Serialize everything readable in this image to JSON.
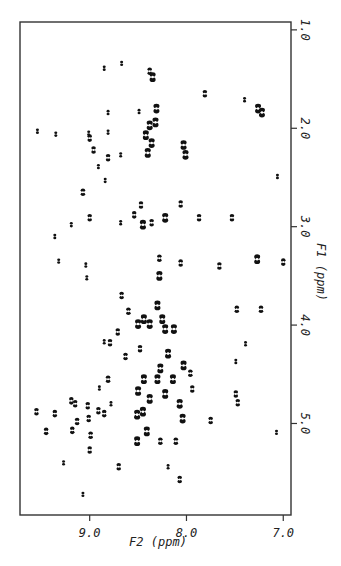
{
  "chart_data": {
    "type": "scatter",
    "subtype": "2D NMR contour plot",
    "title": "",
    "xlabel": "F2  (ppm)",
    "ylabel": "F1  (ppm)",
    "xlim": [
      9.72,
      6.92
    ],
    "ylim": [
      0.92,
      5.93
    ],
    "x_reversed": true,
    "y_direction": "increasing downward",
    "y_axis_side": "right",
    "grid": false,
    "legend": "none",
    "x_ticks": [
      {
        "value": 9.0,
        "label": "9.0"
      },
      {
        "value": 8.0,
        "label": "8.0"
      },
      {
        "value": 7.0,
        "label": "7.0"
      }
    ],
    "y_ticks": [
      {
        "value": 1.0,
        "label": "1.0"
      },
      {
        "value": 2.0,
        "label": "2.0"
      },
      {
        "value": 3.0,
        "label": "3.0"
      },
      {
        "value": 4.0,
        "label": "4.0"
      },
      {
        "value": 5.0,
        "label": "5.0"
      }
    ],
    "peak_color": "#111111",
    "peaks": [
      {
        "f2": 8.85,
        "f1": 1.39,
        "s": 1
      },
      {
        "f2": 8.67,
        "f1": 1.34,
        "s": 1
      },
      {
        "f2": 8.38,
        "f1": 1.42,
        "s": 2
      },
      {
        "f2": 8.35,
        "f1": 1.48,
        "s": 3
      },
      {
        "f2": 7.81,
        "f1": 1.65,
        "s": 2
      },
      {
        "f2": 7.4,
        "f1": 1.71,
        "s": 1
      },
      {
        "f2": 7.26,
        "f1": 1.8,
        "s": 3
      },
      {
        "f2": 7.22,
        "f1": 1.84,
        "s": 3
      },
      {
        "f2": 8.81,
        "f1": 1.84,
        "s": 1
      },
      {
        "f2": 8.49,
        "f1": 1.83,
        "s": 1
      },
      {
        "f2": 8.31,
        "f1": 1.8,
        "s": 3
      },
      {
        "f2": 8.32,
        "f1": 1.94,
        "s": 3
      },
      {
        "f2": 8.38,
        "f1": 1.97,
        "s": 3
      },
      {
        "f2": 8.42,
        "f1": 2.07,
        "s": 3
      },
      {
        "f2": 8.36,
        "f1": 2.15,
        "s": 3
      },
      {
        "f2": 8.4,
        "f1": 2.25,
        "s": 3
      },
      {
        "f2": 9.54,
        "f1": 2.03,
        "s": 1
      },
      {
        "f2": 9.35,
        "f1": 2.06,
        "s": 1
      },
      {
        "f2": 9.01,
        "f1": 2.05,
        "s": 1
      },
      {
        "f2": 9.0,
        "f1": 2.1,
        "s": 2
      },
      {
        "f2": 8.81,
        "f1": 2.04,
        "s": 1
      },
      {
        "f2": 8.96,
        "f1": 2.22,
        "s": 2
      },
      {
        "f2": 8.68,
        "f1": 2.27,
        "s": 1
      },
      {
        "f2": 8.81,
        "f1": 2.3,
        "s": 2
      },
      {
        "f2": 8.03,
        "f1": 2.17,
        "s": 3
      },
      {
        "f2": 8.01,
        "f1": 2.27,
        "s": 3
      },
      {
        "f2": 8.91,
        "f1": 2.39,
        "s": 1
      },
      {
        "f2": 8.84,
        "f1": 2.53,
        "s": 1
      },
      {
        "f2": 9.07,
        "f1": 2.65,
        "s": 2
      },
      {
        "f2": 9.0,
        "f1": 2.91,
        "s": 2
      },
      {
        "f2": 9.19,
        "f1": 2.98,
        "s": 1
      },
      {
        "f2": 9.36,
        "f1": 3.1,
        "s": 1
      },
      {
        "f2": 8.68,
        "f1": 2.96,
        "s": 1
      },
      {
        "f2": 8.54,
        "f1": 2.88,
        "s": 2
      },
      {
        "f2": 8.47,
        "f1": 2.78,
        "s": 2
      },
      {
        "f2": 8.45,
        "f1": 2.98,
        "s": 3
      },
      {
        "f2": 8.36,
        "f1": 2.96,
        "s": 2
      },
      {
        "f2": 8.22,
        "f1": 2.91,
        "s": 3
      },
      {
        "f2": 8.06,
        "f1": 2.77,
        "s": 2
      },
      {
        "f2": 7.87,
        "f1": 2.91,
        "s": 2
      },
      {
        "f2": 7.53,
        "f1": 2.91,
        "s": 2
      },
      {
        "f2": 7.66,
        "f1": 3.4,
        "s": 2
      },
      {
        "f2": 7.27,
        "f1": 3.33,
        "s": 3
      },
      {
        "f2": 7.0,
        "f1": 3.36,
        "s": 2
      },
      {
        "f2": 9.32,
        "f1": 3.35,
        "s": 1
      },
      {
        "f2": 9.04,
        "f1": 3.39,
        "s": 1
      },
      {
        "f2": 8.28,
        "f1": 3.32,
        "s": 2
      },
      {
        "f2": 8.06,
        "f1": 3.37,
        "s": 2
      },
      {
        "f2": 7.06,
        "f1": 2.49,
        "s": 1
      },
      {
        "f2": 9.03,
        "f1": 3.52,
        "s": 1
      },
      {
        "f2": 8.67,
        "f1": 3.7,
        "s": 2
      },
      {
        "f2": 8.28,
        "f1": 3.5,
        "s": 3
      },
      {
        "f2": 8.6,
        "f1": 3.86,
        "s": 2
      },
      {
        "f2": 8.44,
        "f1": 3.94,
        "s": 3
      },
      {
        "f2": 8.5,
        "f1": 3.99,
        "s": 3
      },
      {
        "f2": 8.38,
        "f1": 3.99,
        "s": 3
      },
      {
        "f2": 8.25,
        "f1": 3.94,
        "s": 3
      },
      {
        "f2": 8.22,
        "f1": 4.04,
        "s": 3
      },
      {
        "f2": 8.13,
        "f1": 4.04,
        "s": 3
      },
      {
        "f2": 8.3,
        "f1": 3.8,
        "s": 3
      },
      {
        "f2": 8.79,
        "f1": 4.18,
        "s": 2
      },
      {
        "f2": 8.71,
        "f1": 4.07,
        "s": 2
      },
      {
        "f2": 8.85,
        "f1": 4.17,
        "s": 1
      },
      {
        "f2": 7.48,
        "f1": 3.84,
        "s": 2
      },
      {
        "f2": 7.23,
        "f1": 3.84,
        "s": 2
      },
      {
        "f2": 7.39,
        "f1": 4.19,
        "s": 1
      },
      {
        "f2": 8.63,
        "f1": 4.32,
        "s": 2
      },
      {
        "f2": 8.48,
        "f1": 4.24,
        "s": 2
      },
      {
        "f2": 8.27,
        "f1": 4.44,
        "s": 3
      },
      {
        "f2": 8.19,
        "f1": 4.29,
        "s": 3
      },
      {
        "f2": 8.03,
        "f1": 4.41,
        "s": 3
      },
      {
        "f2": 7.96,
        "f1": 4.49,
        "s": 2
      },
      {
        "f2": 7.49,
        "f1": 4.37,
        "s": 1
      },
      {
        "f2": 8.81,
        "f1": 4.55,
        "s": 2
      },
      {
        "f2": 8.5,
        "f1": 4.67,
        "s": 3
      },
      {
        "f2": 7.94,
        "f1": 4.65,
        "s": 2
      },
      {
        "f2": 7.49,
        "f1": 4.7,
        "s": 2
      },
      {
        "f2": 8.9,
        "f1": 4.64,
        "s": 1
      },
      {
        "f2": 8.38,
        "f1": 4.75,
        "s": 3
      },
      {
        "f2": 8.22,
        "f1": 4.7,
        "s": 3
      },
      {
        "f2": 8.3,
        "f1": 4.55,
        "s": 3
      },
      {
        "f2": 8.14,
        "f1": 4.55,
        "s": 3
      },
      {
        "f2": 8.44,
        "f1": 4.55,
        "s": 3
      },
      {
        "f2": 9.55,
        "f1": 4.88,
        "s": 2
      },
      {
        "f2": 9.36,
        "f1": 4.9,
        "s": 2
      },
      {
        "f2": 9.45,
        "f1": 5.08,
        "s": 2
      },
      {
        "f2": 9.19,
        "f1": 4.77,
        "s": 2
      },
      {
        "f2": 9.15,
        "f1": 4.8,
        "s": 2
      },
      {
        "f2": 9.02,
        "f1": 4.82,
        "s": 2
      },
      {
        "f2": 8.91,
        "f1": 4.87,
        "s": 2
      },
      {
        "f2": 8.85,
        "f1": 4.9,
        "s": 2
      },
      {
        "f2": 8.78,
        "f1": 4.8,
        "s": 1
      },
      {
        "f2": 9.01,
        "f1": 4.95,
        "s": 2
      },
      {
        "f2": 9.13,
        "f1": 4.98,
        "s": 2
      },
      {
        "f2": 9.18,
        "f1": 5.07,
        "s": 2
      },
      {
        "f2": 8.99,
        "f1": 5.12,
        "s": 2
      },
      {
        "f2": 9.0,
        "f1": 5.27,
        "s": 2
      },
      {
        "f2": 8.51,
        "f1": 4.91,
        "s": 3
      },
      {
        "f2": 8.45,
        "f1": 4.88,
        "s": 3
      },
      {
        "f2": 8.51,
        "f1": 5.18,
        "s": 3
      },
      {
        "f2": 8.41,
        "f1": 5.08,
        "s": 3
      },
      {
        "f2": 8.27,
        "f1": 5.18,
        "s": 2
      },
      {
        "f2": 8.11,
        "f1": 5.18,
        "s": 2
      },
      {
        "f2": 8.07,
        "f1": 4.8,
        "s": 3
      },
      {
        "f2": 8.04,
        "f1": 4.95,
        "s": 3
      },
      {
        "f2": 7.75,
        "f1": 4.97,
        "s": 2
      },
      {
        "f2": 7.47,
        "f1": 4.79,
        "s": 2
      },
      {
        "f2": 7.07,
        "f1": 5.09,
        "s": 1
      },
      {
        "f2": 9.27,
        "f1": 5.4,
        "s": 1
      },
      {
        "f2": 8.7,
        "f1": 5.44,
        "s": 2
      },
      {
        "f2": 8.19,
        "f1": 5.44,
        "s": 1
      },
      {
        "f2": 8.07,
        "f1": 5.57,
        "s": 2
      },
      {
        "f2": 9.07,
        "f1": 5.72,
        "s": 1
      }
    ]
  }
}
